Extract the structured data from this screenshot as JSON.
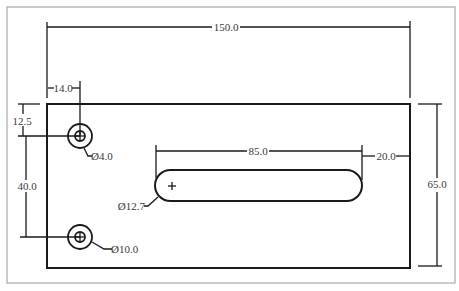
{
  "drawing": {
    "units": "mm",
    "plate": {
      "width_label": "150.0",
      "height_label": "65.0"
    },
    "dimensions": {
      "overall_width": "150.0",
      "overall_height": "65.0",
      "hole_x_offset": "14.0",
      "top_hole_y_offset": "12.5",
      "hole_spacing": "40.0",
      "slot_length": "85.0",
      "slot_right_offset": "20.0"
    },
    "callouts": {
      "small_hole": "Ø4.0",
      "large_hole": "Ø10.0",
      "slot_width": "Ø12.7"
    },
    "colors": {
      "line": "#1a1a1a",
      "frame": "#a9a9a9",
      "text": "#3a3a3a",
      "background": "#ffffff"
    }
  }
}
